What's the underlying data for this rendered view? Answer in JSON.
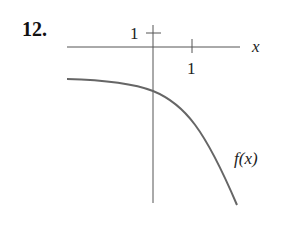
{
  "problem_number": "12.",
  "graph": {
    "x_axis_label": "x",
    "x_tick_label": "1",
    "y_tick_label": "1",
    "curve_label": "f(x)",
    "colors": {
      "axis": "#555555",
      "curve": "#666666"
    }
  }
}
